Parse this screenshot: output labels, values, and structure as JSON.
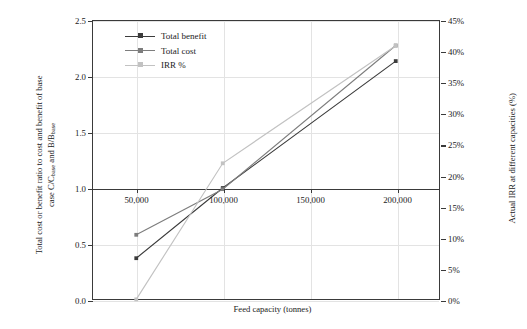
{
  "chart_data": {
    "type": "line",
    "title": "",
    "xlabel": "Feed capacity (tonnes)",
    "ylabel_left_line1": "Total cost or benefit ratio to cost and benefit of base",
    "ylabel_left_line2_pre": "case C/C",
    "ylabel_left_sub1": "base",
    "ylabel_left_line2_mid": " and B/B",
    "ylabel_left_sub2": "base",
    "ylabel_right": "Actual IRR at different capacities (%)",
    "x": [
      50000,
      100000,
      200000
    ],
    "xlim": [
      25000,
      225000
    ],
    "ylim_left": [
      0.0,
      2.5
    ],
    "ylim_right": [
      0,
      45
    ],
    "grid": true,
    "legend_position": "top-left",
    "xtick_labels": [
      "50,000",
      "100,000",
      "150,000",
      "200,000"
    ],
    "xtick_values": [
      50000,
      100000,
      150000,
      200000
    ],
    "ytick_labels_left": [
      "0.0",
      "0.5",
      "1.0",
      "1.5",
      "2.0",
      "2.5"
    ],
    "ytick_values_left": [
      0.0,
      0.5,
      1.0,
      1.5,
      2.0,
      2.5
    ],
    "ytick_labels_right": [
      "0%",
      "5%",
      "10%",
      "15%",
      "20%",
      "25%",
      "30%",
      "35%",
      "40%",
      "45%"
    ],
    "ytick_values_right": [
      0,
      5,
      10,
      15,
      20,
      25,
      30,
      35,
      40,
      45
    ],
    "series": [
      {
        "name": "Total benefit",
        "axis": "left",
        "color": "#3b3b3b",
        "marker": "square",
        "values": [
          0.37,
          1.0,
          2.14
        ]
      },
      {
        "name": "Total cost",
        "axis": "left",
        "color": "#7d7d7d",
        "marker": "square",
        "values": [
          0.58,
          0.99,
          2.28
        ]
      },
      {
        "name": "IRR %",
        "axis": "right",
        "color": "#c2c2c2",
        "marker": "square",
        "values": [
          0.0,
          22.0,
          41.0
        ]
      }
    ]
  },
  "legend": {
    "items": [
      {
        "label": "Total benefit",
        "color": "#3b3b3b"
      },
      {
        "label": "Total cost",
        "color": "#7d7d7d"
      },
      {
        "label": "IRR %",
        "color": "#c2c2c2"
      }
    ]
  },
  "colors": {
    "axis": "#3a3a3a",
    "grid": "#e3e3e3",
    "background": "#ffffff",
    "text": "#1a1a1a"
  }
}
